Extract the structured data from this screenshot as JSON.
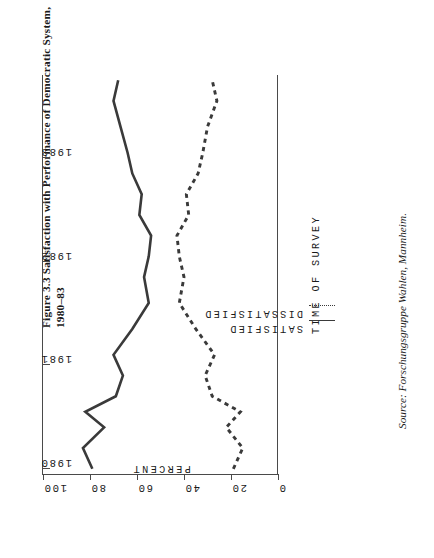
{
  "figure": {
    "title": "Figure 3.3  Satisfaction with  Performance  of  Democratic  System,\n1980–83",
    "source_prefix": "Source:",
    "source_text": " Forschungsgruppe Wahlen, Mannheim."
  },
  "legend": {
    "entries": [
      {
        "label": "SATISFIED",
        "style": "solid",
        "color": "#3a3a3a"
      },
      {
        "label": "DISSATISFIED",
        "style": "dotted",
        "color": "#3a3a3a"
      }
    ]
  },
  "axes": {
    "percent": {
      "title": "PERCENT",
      "ticks": [
        "100",
        "80",
        "60",
        "40",
        "20",
        "0"
      ],
      "min": 0,
      "max": 100
    },
    "time": {
      "title": "TIME  OF  SURVEY",
      "ticks": [
        "1980",
        "1981",
        "1982",
        "1983"
      ],
      "min": 1980.0,
      "max": 1983.85
    }
  },
  "chart_data": {
    "type": "line",
    "xlabel": "TIME OF SURVEY",
    "ylabel": "PERCENT",
    "orientation": "rotated-90ccw",
    "xlim": [
      1980.0,
      1983.85
    ],
    "ylim": [
      0,
      100
    ],
    "grid": false,
    "legend_position": "inside-left",
    "x": [
      1980.05,
      1980.25,
      1980.45,
      1980.6,
      1980.75,
      1980.95,
      1981.15,
      1981.4,
      1981.65,
      1981.9,
      1982.1,
      1982.3,
      1982.5,
      1982.7,
      1982.9,
      1983.1,
      1983.35,
      1983.6,
      1983.8
    ],
    "x_tick_labels": [
      "1980",
      "1981",
      "1982",
      "1983"
    ],
    "series": [
      {
        "name": "SATISFIED",
        "style": "solid",
        "color": "#3a3a3a",
        "values": [
          79,
          83,
          74,
          82,
          69,
          66,
          70,
          62,
          55,
          57,
          55,
          54,
          59,
          58,
          62,
          64,
          67,
          70,
          68
        ]
      },
      {
        "name": "DISSATISFIED",
        "style": "dotted",
        "color": "#3a3a3a",
        "values": [
          19,
          15,
          22,
          16,
          28,
          31,
          27,
          35,
          42,
          40,
          42,
          43,
          38,
          39,
          34,
          32,
          30,
          26,
          28
        ]
      }
    ]
  }
}
